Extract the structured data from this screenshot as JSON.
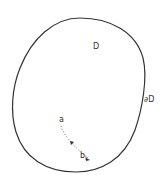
{
  "diagram": {
    "region_label": "D",
    "boundary_label": "∂D",
    "start_point_label": "a",
    "end_point_label": "b",
    "end_point_subscript": "k",
    "stroke_color": "#333333",
    "background": "#ffffff"
  }
}
